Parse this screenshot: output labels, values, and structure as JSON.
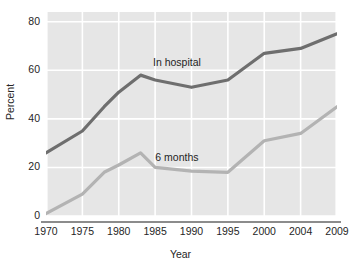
{
  "chart_data": {
    "type": "line",
    "title": "",
    "subtitle": "",
    "xlabel": "Year",
    "ylabel": "Percent",
    "x": [
      1970,
      1975,
      1980,
      1985,
      1990,
      1995,
      2000,
      2004,
      2009
    ],
    "xtick_labels": [
      "1970",
      "1975",
      "1980",
      "1985",
      "1990",
      "1995",
      "2000",
      "2004",
      "2009"
    ],
    "ytick_labels": [
      "0",
      "20",
      "40",
      "60",
      "80"
    ],
    "yticks": [
      0,
      20,
      40,
      60,
      80
    ],
    "ylim": [
      0,
      84
    ],
    "xlim": [
      1970,
      2009
    ],
    "grid": true,
    "grid_color": "#ffffff",
    "plot_background": "#e6e6e6",
    "legend_position": "in-plot-annotations",
    "series": [
      {
        "name": "In hospital",
        "color": "#6e6e6e",
        "label_x": 1988,
        "label_y": 63,
        "points": [
          {
            "x": 1970,
            "y": 26
          },
          {
            "x": 1975,
            "y": 35
          },
          {
            "x": 1978,
            "y": 45
          },
          {
            "x": 1980,
            "y": 51
          },
          {
            "x": 1983,
            "y": 58
          },
          {
            "x": 1985,
            "y": 56
          },
          {
            "x": 1990,
            "y": 53
          },
          {
            "x": 1995,
            "y": 56
          },
          {
            "x": 2000,
            "y": 67
          },
          {
            "x": 2004,
            "y": 69
          },
          {
            "x": 2009,
            "y": 75
          }
        ]
      },
      {
        "name": "6 months",
        "color": "#b3b3b3",
        "label_x": 1988,
        "label_y": 24,
        "points": [
          {
            "x": 1970,
            "y": 1
          },
          {
            "x": 1975,
            "y": 9
          },
          {
            "x": 1978,
            "y": 18
          },
          {
            "x": 1980,
            "y": 21
          },
          {
            "x": 1983,
            "y": 26
          },
          {
            "x": 1985,
            "y": 20
          },
          {
            "x": 1990,
            "y": 18.5
          },
          {
            "x": 1995,
            "y": 18
          },
          {
            "x": 2000,
            "y": 31
          },
          {
            "x": 2004,
            "y": 34
          },
          {
            "x": 2009,
            "y": 45
          }
        ]
      }
    ]
  }
}
